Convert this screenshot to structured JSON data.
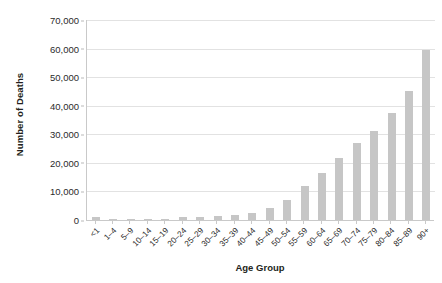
{
  "chart_data": {
    "type": "bar",
    "title": "",
    "subtitle": "",
    "xlabel": "Age Group",
    "ylabel": "Number of Deaths",
    "categories": [
      "<1",
      "1–4",
      "5–9",
      "10–14",
      "15–19",
      "20–24",
      "25–29",
      "30–34",
      "35–39",
      "40–44",
      "45–49",
      "50–54",
      "55–59",
      "60–64",
      "65–69",
      "70–74",
      "75–79",
      "80–84",
      "85–89",
      "90+"
    ],
    "values": [
      1200,
      150,
      120,
      180,
      500,
      900,
      1100,
      1300,
      1700,
      2600,
      4200,
      7000,
      11900,
      16600,
      21800,
      26800,
      31200,
      37500,
      45200,
      59500
    ],
    "ylim": [
      0,
      70000
    ],
    "ytick_values": [
      0,
      10000,
      20000,
      30000,
      40000,
      50000,
      60000,
      70000
    ],
    "ytick_labels": [
      "0",
      "10,000",
      "20,000",
      "30,000",
      "40,000",
      "50,000",
      "60,000",
      "70,000"
    ],
    "grid": true,
    "grid_axis": "y",
    "legend": false,
    "legend_position": "none",
    "bar_color": "#c6c6c6",
    "grid_color": "#e2e2e2",
    "axis_color": "#c9c9c9",
    "text_color": "#231f20",
    "background_color": "#ffffff"
  }
}
